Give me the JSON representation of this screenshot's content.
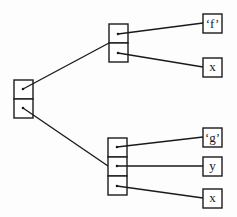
{
  "diagram": {
    "type": "pointer-structure tree",
    "root": {
      "id": "root",
      "cells": 2
    },
    "upper_node": {
      "id": "node-upper",
      "cells": 2
    },
    "lower_node": {
      "id": "node-lower",
      "cells": 3
    },
    "leaves": [
      {
        "id": "leaf-f",
        "label": "‘f’",
        "parent": "node-upper",
        "cell": 0
      },
      {
        "id": "leaf-x1",
        "label": "x",
        "parent": "node-upper",
        "cell": 1
      },
      {
        "id": "leaf-g",
        "label": "‘g’",
        "parent": "node-lower",
        "cell": 0
      },
      {
        "id": "leaf-y",
        "label": "y",
        "parent": "node-lower",
        "cell": 1
      },
      {
        "id": "leaf-x2",
        "label": "x",
        "parent": "node-lower",
        "cell": 2
      }
    ],
    "colors": {
      "stroke": "#1a1a1a",
      "background": "#fdfdfd"
    }
  }
}
